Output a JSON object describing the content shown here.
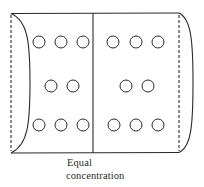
{
  "figure": {
    "caption_lines": [
      "Equal",
      "concentration"
    ],
    "stroke_color": "#2a2a2a",
    "background_color": "#ffffff"
  },
  "cylinder": {
    "top_y": 13,
    "bottom_y": 153,
    "left_x": 11,
    "right_x": 179,
    "left_arc_bulge_x": 30,
    "right_arc_bulge_x": 193,
    "divider_x": 93
  },
  "compartments": [
    {
      "name": "left",
      "particles": [
        {
          "cx": 39,
          "cy": 42
        },
        {
          "cx": 61,
          "cy": 42
        },
        {
          "cx": 83,
          "cy": 42
        },
        {
          "cx": 51,
          "cy": 86
        },
        {
          "cx": 73,
          "cy": 86
        },
        {
          "cx": 39,
          "cy": 125
        },
        {
          "cx": 61,
          "cy": 125
        },
        {
          "cx": 83,
          "cy": 125
        }
      ]
    },
    {
      "name": "right",
      "particles": [
        {
          "cx": 113,
          "cy": 42
        },
        {
          "cx": 136,
          "cy": 42
        },
        {
          "cx": 158,
          "cy": 42
        },
        {
          "cx": 126,
          "cy": 86
        },
        {
          "cx": 148,
          "cy": 86
        },
        {
          "cx": 114,
          "cy": 125
        },
        {
          "cx": 136,
          "cy": 125
        },
        {
          "cx": 158,
          "cy": 125
        }
      ]
    }
  ],
  "particle_radius": 6
}
